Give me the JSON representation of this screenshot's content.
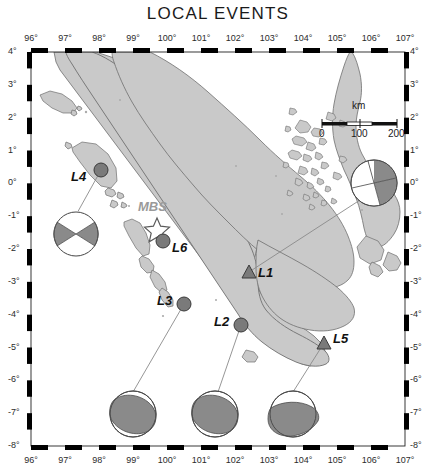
{
  "figure": {
    "title": "LOCAL EVENTS",
    "map_region": "Sumatra, Indonesia",
    "frame_style": "checkered black and white"
  },
  "axes": {
    "x_label_unit": "°",
    "y_label_unit": "°",
    "x_ticks": [
      "96",
      "97",
      "98",
      "99",
      "100",
      "101",
      "102",
      "103",
      "104",
      "105",
      "106",
      "107"
    ],
    "y_ticks": [
      "4",
      "3",
      "2",
      "1",
      "0",
      "-1",
      "-2",
      "-3",
      "-4",
      "-5",
      "-6",
      "-7",
      "-8"
    ],
    "x_range": [
      96,
      107
    ],
    "y_range": [
      -8,
      4
    ]
  },
  "scalebar": {
    "unit_label": "km",
    "ticks": [
      "0",
      "100",
      "200"
    ]
  },
  "station": {
    "name": "MBS",
    "marker": "star"
  },
  "events": [
    {
      "id": "L1",
      "marker": "triangle",
      "label": "L1"
    },
    {
      "id": "L2",
      "marker": "circle",
      "label": "L2"
    },
    {
      "id": "L3",
      "marker": "circle",
      "label": "L3"
    },
    {
      "id": "L4",
      "marker": "circle",
      "label": "L4"
    },
    {
      "id": "L5",
      "marker": "triangle",
      "label": "L5"
    },
    {
      "id": "L6",
      "marker": "circle",
      "label": "L6"
    }
  ],
  "colors": {
    "land": "#c9c9c9",
    "land_stroke": "#6f6f6f",
    "ocean": "#ffffff",
    "marker_fill": "#7a7a7a",
    "marker_stroke": "#3a3a3a",
    "beachball_dark": "#8a8a8a",
    "beachball_light": "#ffffff",
    "frame": "#000000",
    "leader_line": "#888888",
    "text": "#111111",
    "station_text": "#9a9a9a"
  }
}
